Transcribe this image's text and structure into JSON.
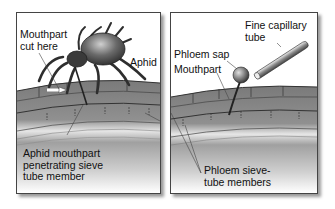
{
  "figure": {
    "panels": [
      {
        "id": "left",
        "labels": {
          "mouthpart_cut": "Mouthpart\ncut here",
          "aphid": "Aphid",
          "penetrating": "Aphid mouthpart\npenetrating sieve\ntube member"
        }
      },
      {
        "id": "right",
        "labels": {
          "capillary": "Fine capillary\ntube",
          "phloem_sap": "Phloem sap",
          "mouthpart": "Mouthpart",
          "sieve_tube": "Phloem sieve-\ntube members"
        }
      }
    ],
    "colors": {
      "stem_dark": "#6e6e6e",
      "stem_light": "#d8d8d8",
      "insect": "#3a3a3a",
      "panel_border": "#444444"
    }
  }
}
